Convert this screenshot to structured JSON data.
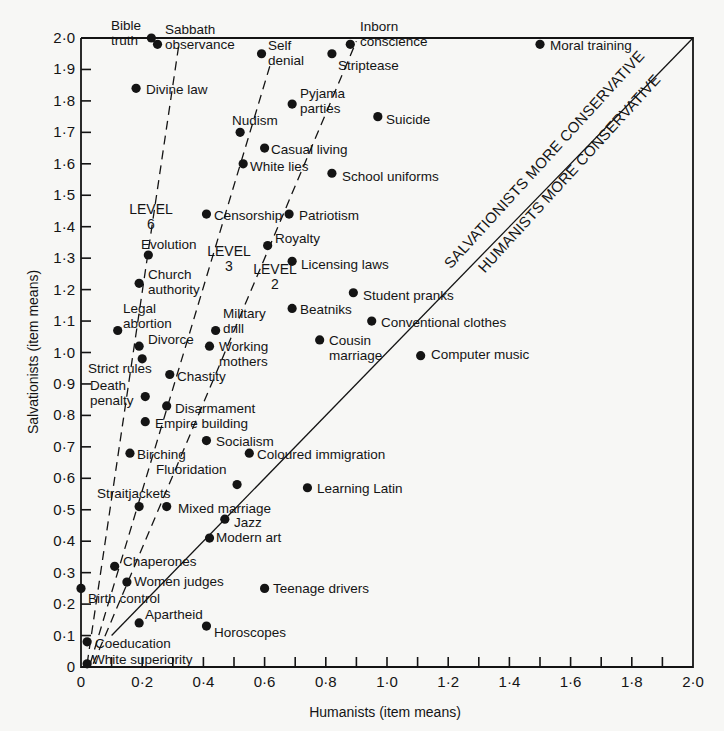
{
  "chart_data": {
    "type": "scatter",
    "title": "",
    "xlabel": "Humanists (item means)",
    "ylabel": "Salvationists (item means)",
    "xlim": [
      0,
      2.0
    ],
    "ylim": [
      0,
      2.0
    ],
    "grid": false,
    "x_ticks": [
      "0",
      "0·2",
      "0·4",
      "0·6",
      "0·8",
      "1·0",
      "1·2",
      "1·4",
      "1·6",
      "1·8",
      "2·0"
    ],
    "y_ticks": [
      "0",
      "0·1",
      "0·2",
      "0·3",
      "0·4",
      "0·5",
      "0·6",
      "0·7",
      "0·8",
      "0·9",
      "1·0",
      "1·1",
      "1·2",
      "1·3",
      "1·4",
      "1·5",
      "1·6",
      "1·7",
      "1·8",
      "1·9",
      "2·0"
    ],
    "diagonal_annotations": [
      "SALVATIONISTS MORE CONSERVATIVE",
      "HUMANISTS MORE CONSERVATIVE"
    ],
    "level_lines": [
      {
        "label": "LEVEL 6",
        "from": [
          0.02,
          0.01
        ],
        "to": [
          0.32,
          1.98
        ]
      },
      {
        "label": "LEVEL 3",
        "from": [
          0.03,
          0.01
        ],
        "to": [
          0.62,
          1.92
        ]
      },
      {
        "label": "LEVEL 2",
        "from": [
          0.04,
          0.01
        ],
        "to": [
          0.9,
          1.99
        ]
      }
    ],
    "points": [
      {
        "label": "Bible truth",
        "x": 0.23,
        "y": 2.0
      },
      {
        "label": "Sabbath observance",
        "x": 0.25,
        "y": 1.98
      },
      {
        "label": "Self denial",
        "x": 0.59,
        "y": 1.95
      },
      {
        "label": "Striptease",
        "x": 0.82,
        "y": 1.95
      },
      {
        "label": "Inborn conscience",
        "x": 0.88,
        "y": 1.98
      },
      {
        "label": "Moral training",
        "x": 1.5,
        "y": 1.98
      },
      {
        "label": "Divine law",
        "x": 0.18,
        "y": 1.84
      },
      {
        "label": "Pyjama parties",
        "x": 0.69,
        "y": 1.79
      },
      {
        "label": "Suicide",
        "x": 0.97,
        "y": 1.75
      },
      {
        "label": "Nudism",
        "x": 0.52,
        "y": 1.7
      },
      {
        "label": "Casual living",
        "x": 0.6,
        "y": 1.65
      },
      {
        "label": "White lies",
        "x": 0.53,
        "y": 1.6
      },
      {
        "label": "School uniforms",
        "x": 0.82,
        "y": 1.57
      },
      {
        "label": "Censorship",
        "x": 0.41,
        "y": 1.44
      },
      {
        "label": "Patriotism",
        "x": 0.68,
        "y": 1.44
      },
      {
        "label": "Royalty",
        "x": 0.61,
        "y": 1.34
      },
      {
        "label": "Evolution",
        "x": 0.22,
        "y": 1.31
      },
      {
        "label": "Licensing laws",
        "x": 0.69,
        "y": 1.29
      },
      {
        "label": "Church authority",
        "x": 0.19,
        "y": 1.22
      },
      {
        "label": "Student pranks",
        "x": 0.89,
        "y": 1.19
      },
      {
        "label": "Beatniks",
        "x": 0.69,
        "y": 1.14
      },
      {
        "label": "Conventional clothes",
        "x": 0.95,
        "y": 1.1
      },
      {
        "label": "Legal abortion",
        "x": 0.12,
        "y": 1.07
      },
      {
        "label": "Military drill",
        "x": 0.44,
        "y": 1.07
      },
      {
        "label": "Cousin marriage",
        "x": 0.78,
        "y": 1.04
      },
      {
        "label": "Divorce",
        "x": 0.19,
        "y": 1.02
      },
      {
        "label": "Working mothers",
        "x": 0.42,
        "y": 1.02
      },
      {
        "label": "Computer music",
        "x": 1.11,
        "y": 0.99
      },
      {
        "label": "Strict rules",
        "x": 0.2,
        "y": 0.98
      },
      {
        "label": "Chastity",
        "x": 0.29,
        "y": 0.93
      },
      {
        "label": "Death penalty",
        "x": 0.21,
        "y": 0.86
      },
      {
        "label": "Disarmament",
        "x": 0.28,
        "y": 0.83
      },
      {
        "label": "Empire building",
        "x": 0.21,
        "y": 0.78
      },
      {
        "label": "Socialism",
        "x": 0.41,
        "y": 0.72
      },
      {
        "label": "Birching",
        "x": 0.16,
        "y": 0.68
      },
      {
        "label": "Coloured immigration",
        "x": 0.55,
        "y": 0.68
      },
      {
        "label": "Fluoridation",
        "x": 0.51,
        "y": 0.58
      },
      {
        "label": "Learning Latin",
        "x": 0.74,
        "y": 0.57
      },
      {
        "label": "Straitjackets",
        "x": 0.19,
        "y": 0.51
      },
      {
        "label": "Mixed marriage",
        "x": 0.28,
        "y": 0.51
      },
      {
        "label": "Jazz",
        "x": 0.47,
        "y": 0.47
      },
      {
        "label": "Modern art",
        "x": 0.42,
        "y": 0.41
      },
      {
        "label": "Chaperones",
        "x": 0.11,
        "y": 0.32
      },
      {
        "label": "Women judges",
        "x": 0.15,
        "y": 0.27
      },
      {
        "label": "Birth control",
        "x": 0.0,
        "y": 0.25
      },
      {
        "label": "Teenage drivers",
        "x": 0.6,
        "y": 0.25
      },
      {
        "label": "Apartheid",
        "x": 0.19,
        "y": 0.14
      },
      {
        "label": "Horoscopes",
        "x": 0.41,
        "y": 0.13
      },
      {
        "label": "Coeducation",
        "x": 0.02,
        "y": 0.08
      },
      {
        "label": "White superiority",
        "x": 0.02,
        "y": 0.01
      }
    ]
  },
  "labels": [
    {
      "lines": [
        "Bible",
        "truth"
      ],
      "x": 111,
      "y": 30,
      "anchor": "start"
    },
    {
      "lines": [
        "Sabbath",
        "observance"
      ],
      "x": 165,
      "y": 34,
      "anchor": "start"
    },
    {
      "lines": [
        "Self",
        "denial"
      ],
      "x": 268,
      "y": 50,
      "anchor": "start"
    },
    {
      "lines": [
        "Striptease"
      ],
      "x": 338,
      "y": 70,
      "anchor": "start"
    },
    {
      "lines": [
        "Inborn",
        "conscience"
      ],
      "x": 360,
      "y": 31,
      "anchor": "start"
    },
    {
      "lines": [
        "Moral training"
      ],
      "x": 550,
      "y": 50,
      "anchor": "start"
    },
    {
      "lines": [
        "Divine law"
      ],
      "x": 146,
      "y": 94,
      "anchor": "start"
    },
    {
      "lines": [
        "Pyjama",
        "parties"
      ],
      "x": 300,
      "y": 98,
      "anchor": "start"
    },
    {
      "lines": [
        "Suicide"
      ],
      "x": 386,
      "y": 124,
      "anchor": "start"
    },
    {
      "lines": [
        "Nudism"
      ],
      "x": 232,
      "y": 125,
      "anchor": "start"
    },
    {
      "lines": [
        "Casual living"
      ],
      "x": 271,
      "y": 154,
      "anchor": "start"
    },
    {
      "lines": [
        "White lies"
      ],
      "x": 250,
      "y": 171,
      "anchor": "start"
    },
    {
      "lines": [
        "School uniforms"
      ],
      "x": 342,
      "y": 181,
      "anchor": "start"
    },
    {
      "lines": [
        "Censorship"
      ],
      "x": 214,
      "y": 220,
      "anchor": "start"
    },
    {
      "lines": [
        "Patriotism"
      ],
      "x": 299,
      "y": 220,
      "anchor": "start"
    },
    {
      "lines": [
        "Royalty"
      ],
      "x": 275,
      "y": 243,
      "anchor": "start"
    },
    {
      "lines": [
        "Evolution"
      ],
      "x": 141,
      "y": 249,
      "anchor": "start"
    },
    {
      "lines": [
        "Licensing laws"
      ],
      "x": 301,
      "y": 269,
      "anchor": "start"
    },
    {
      "lines": [
        "Church",
        "authority"
      ],
      "x": 148,
      "y": 279,
      "anchor": "start"
    },
    {
      "lines": [
        "Student pranks"
      ],
      "x": 363,
      "y": 300,
      "anchor": "start"
    },
    {
      "lines": [
        "Beatniks"
      ],
      "x": 300,
      "y": 314,
      "anchor": "start"
    },
    {
      "lines": [
        "Conventional clothes"
      ],
      "x": 381,
      "y": 327,
      "anchor": "start"
    },
    {
      "lines": [
        "Legal",
        "abortion"
      ],
      "x": 123,
      "y": 313,
      "anchor": "start"
    },
    {
      "lines": [
        "Military",
        "drill"
      ],
      "x": 223,
      "y": 318,
      "anchor": "start"
    },
    {
      "lines": [
        "Cousin",
        "marriage"
      ],
      "x": 329,
      "y": 345,
      "anchor": "start"
    },
    {
      "lines": [
        "Divorce"
      ],
      "x": 148,
      "y": 344,
      "anchor": "start"
    },
    {
      "lines": [
        "Working",
        "mothers"
      ],
      "x": 219,
      "y": 351,
      "anchor": "start"
    },
    {
      "lines": [
        "Computer music"
      ],
      "x": 431,
      "y": 359,
      "anchor": "start"
    },
    {
      "lines": [
        "Strict rules"
      ],
      "x": 88,
      "y": 373,
      "anchor": "start"
    },
    {
      "lines": [
        "Chastity"
      ],
      "x": 177,
      "y": 381,
      "anchor": "start"
    },
    {
      "lines": [
        "Death",
        "penalty"
      ],
      "x": 90,
      "y": 390,
      "anchor": "start"
    },
    {
      "lines": [
        "Disarmament"
      ],
      "x": 175,
      "y": 413,
      "anchor": "start"
    },
    {
      "lines": [
        "Empire building"
      ],
      "x": 155,
      "y": 428,
      "anchor": "start"
    },
    {
      "lines": [
        "Socialism"
      ],
      "x": 216,
      "y": 446,
      "anchor": "start"
    },
    {
      "lines": [
        "Birching"
      ],
      "x": 137,
      "y": 459,
      "anchor": "start"
    },
    {
      "lines": [
        "Coloured immigration"
      ],
      "x": 257,
      "y": 459,
      "anchor": "start"
    },
    {
      "lines": [
        "Fluoridation"
      ],
      "x": 156,
      "y": 474,
      "anchor": "start"
    },
    {
      "lines": [
        "Learning Latin"
      ],
      "x": 317,
      "y": 493,
      "anchor": "start"
    },
    {
      "lines": [
        "Straitjackets"
      ],
      "x": 97,
      "y": 498,
      "anchor": "start"
    },
    {
      "lines": [
        "Mixed marriage"
      ],
      "x": 178,
      "y": 513,
      "anchor": "start"
    },
    {
      "lines": [
        "Jazz"
      ],
      "x": 234,
      "y": 527,
      "anchor": "start"
    },
    {
      "lines": [
        "Modern art"
      ],
      "x": 216,
      "y": 542,
      "anchor": "start"
    },
    {
      "lines": [
        "Chaperones"
      ],
      "x": 123,
      "y": 566,
      "anchor": "start"
    },
    {
      "lines": [
        "Women judges"
      ],
      "x": 134,
      "y": 586,
      "anchor": "start"
    },
    {
      "lines": [
        "Birth control"
      ],
      "x": 88,
      "y": 603,
      "anchor": "start"
    },
    {
      "lines": [
        "Teenage drivers"
      ],
      "x": 273,
      "y": 593,
      "anchor": "start"
    },
    {
      "lines": [
        "Apartheid"
      ],
      "x": 145,
      "y": 619,
      "anchor": "start"
    },
    {
      "lines": [
        "Horoscopes"
      ],
      "x": 214,
      "y": 637,
      "anchor": "start"
    },
    {
      "lines": [
        "Coeducation"
      ],
      "x": 95,
      "y": 648,
      "anchor": "start"
    },
    {
      "lines": [
        "White superiority"
      ],
      "x": 92,
      "y": 664,
      "anchor": "start"
    }
  ],
  "level_labels": [
    {
      "lines": [
        "LEVEL",
        "6"
      ],
      "x": 151,
      "y": 214
    },
    {
      "lines": [
        "LEVEL",
        "3"
      ],
      "x": 229,
      "y": 256
    },
    {
      "lines": [
        "LEVEL",
        "2"
      ],
      "x": 275,
      "y": 274
    }
  ],
  "colors": {
    "ink": "#141414",
    "paper": "#f7f7f5"
  }
}
